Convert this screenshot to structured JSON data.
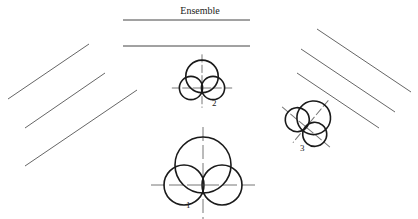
{
  "diagram": {
    "title": "Ensemble",
    "colors": {
      "stroke": "#1a1a1a",
      "line": "#666666",
      "background": "#ffffff"
    },
    "ensemble_bars": [
      {
        "x1": 123,
        "y1": 20,
        "x2": 250,
        "y2": 20
      },
      {
        "x1": 123,
        "y1": 46,
        "x2": 250,
        "y2": 46
      }
    ],
    "left_lines": [
      {
        "x1": 8,
        "y1": 99,
        "x2": 89,
        "y2": 44
      },
      {
        "x1": 25,
        "y1": 128,
        "x2": 105,
        "y2": 73
      },
      {
        "x1": 25,
        "y1": 166,
        "x2": 137,
        "y2": 90
      }
    ],
    "right_lines": [
      {
        "x1": 317,
        "y1": 29,
        "x2": 411,
        "y2": 92
      },
      {
        "x1": 301,
        "y1": 49,
        "x2": 395,
        "y2": 112
      },
      {
        "x1": 297,
        "y1": 73,
        "x2": 379,
        "y2": 128
      }
    ],
    "figures": [
      {
        "id": 1,
        "label": "1",
        "cx": 203,
        "cy": 185,
        "scale": 1.0,
        "rotation": 0,
        "label_x": 186,
        "label_y": 200
      },
      {
        "id": 2,
        "label": "2",
        "cx": 202,
        "cy": 88,
        "scale": 0.58,
        "rotation": 0,
        "label_x": 212,
        "label_y": 98
      },
      {
        "id": 3,
        "label": "3",
        "cx": 306,
        "cy": 127,
        "scale": 0.6,
        "rotation": 40,
        "label_x": 300,
        "label_y": 143
      }
    ]
  }
}
